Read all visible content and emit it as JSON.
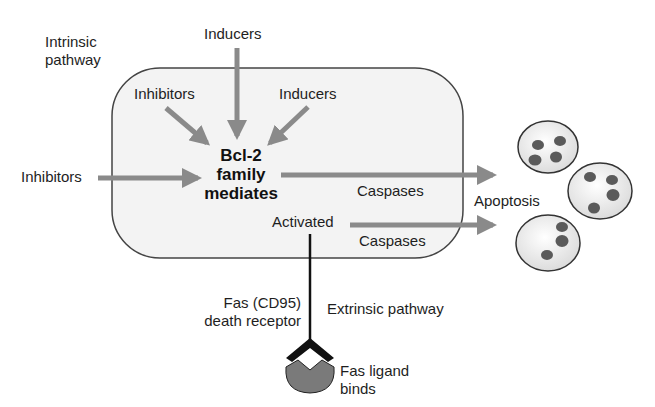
{
  "diagram": {
    "labels": {
      "intrinsic_pathway": "Intrinsic\npathway",
      "inducers_top": "Inducers",
      "inhibitors_inner": "Inhibitors",
      "inducers_inner": "Inducers",
      "inhibitors_left": "Inhibitors",
      "bcl2_line1": "Bcl-2",
      "bcl2_line2": "family",
      "bcl2_line3": "mediates",
      "caspases_upper": "Caspases",
      "activated": "Activated",
      "caspases_lower": "Caspases",
      "apoptosis": "Apoptosis",
      "fas_receptor_line1": "Fas (CD95)",
      "fas_receptor_line2": "death receptor",
      "extrinsic_pathway": "Extrinsic pathway",
      "fas_ligand_line1": "Fas ligand",
      "fas_ligand_line2": "binds"
    },
    "nodes": [
      {
        "id": "cell",
        "type": "rounded-rect",
        "label": "cell (intrinsic pathway region)"
      },
      {
        "id": "bcl2",
        "label": "Bcl-2 family mediates"
      },
      {
        "id": "activated",
        "label": "Activated"
      },
      {
        "id": "apoptotic_cells",
        "label": "Apoptosis",
        "count": 3
      },
      {
        "id": "fas_receptor",
        "label": "Fas (CD95) death receptor"
      },
      {
        "id": "fas_ligand",
        "label": "Fas ligand binds"
      }
    ],
    "edges": [
      {
        "from": "Inducers (top)",
        "to": "bcl2"
      },
      {
        "from": "Inhibitors (inner)",
        "to": "bcl2"
      },
      {
        "from": "Inducers (inner)",
        "to": "bcl2"
      },
      {
        "from": "Inhibitors (left)",
        "to": "bcl2"
      },
      {
        "from": "bcl2",
        "to": "apoptotic_cells",
        "label": "Caspases"
      },
      {
        "from": "activated",
        "to": "apoptotic_cells",
        "label": "Caspases"
      },
      {
        "from": "fas_ligand",
        "to": "activated",
        "via": "fas_receptor"
      }
    ],
    "colors": {
      "arrow": "#8a8a8a",
      "box_fill": "#f3f3f3",
      "box_stroke": "#444444",
      "nucleus": "#5a5a5a",
      "ligand": "#7a7a7a",
      "receptor": "#111111"
    }
  }
}
